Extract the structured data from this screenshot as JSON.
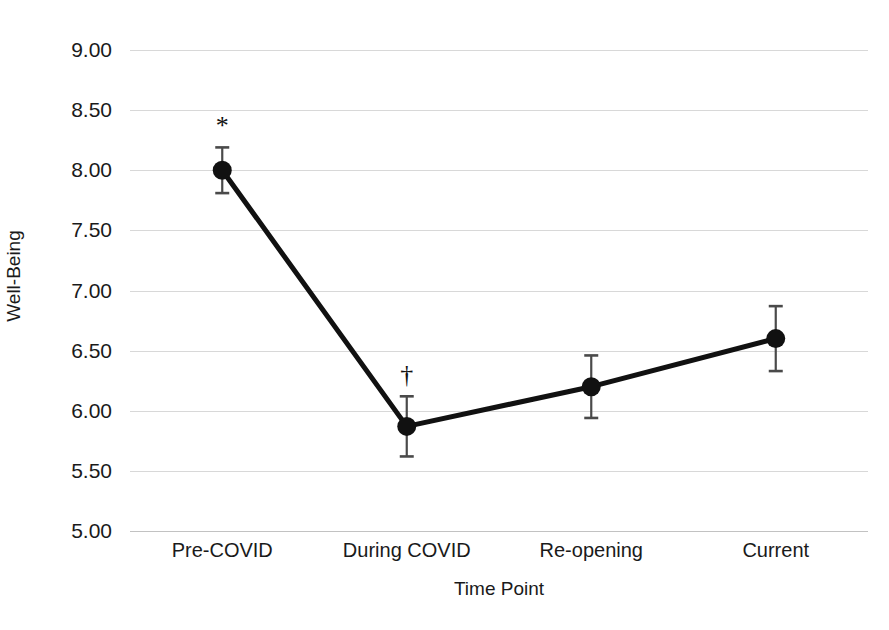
{
  "chart_data": {
    "type": "line",
    "title": "",
    "xlabel": "Time Point",
    "ylabel": "Well-Being",
    "categories": [
      "Pre-COVID",
      "During COVID",
      "Re-opening",
      "Current"
    ],
    "values": [
      8.0,
      5.87,
      6.2,
      6.6
    ],
    "errors": [
      0.19,
      0.25,
      0.26,
      0.27
    ],
    "annotations": [
      "*",
      "†",
      "",
      ""
    ],
    "ylim": [
      5.0,
      9.0
    ],
    "ytick_labels": [
      "9.00",
      "8.50",
      "8.00",
      "7.50",
      "7.00",
      "6.50",
      "6.00",
      "5.50",
      "5.00"
    ],
    "ytick_values": [
      9.0,
      8.5,
      8.0,
      7.5,
      7.0,
      6.5,
      6.0,
      5.5,
      5.0
    ],
    "grid": true,
    "legend": "none",
    "series": [
      {
        "name": "Well-Being",
        "values": [
          8.0,
          5.87,
          6.2,
          6.6
        ],
        "errors": [
          0.19,
          0.25,
          0.26,
          0.27
        ]
      }
    ],
    "colors": {
      "line": "#111111",
      "marker": "#111111",
      "errorbar": "#4a4a4a",
      "grid": "#d8d8d8",
      "background": "#ffffff",
      "text": "#1a1a1a"
    }
  }
}
